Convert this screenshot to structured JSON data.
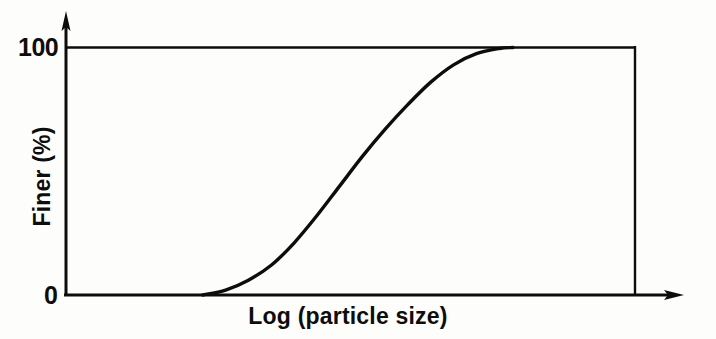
{
  "figure": {
    "background_color": "#fdfdfb",
    "ink_color": "#0d0d0d"
  },
  "axes": {
    "y_tick_top_label": "100",
    "y_tick_bottom_label": "0",
    "y_axis_label": "Finer (%)",
    "x_axis_label": "Log (particle size)"
  },
  "chart_data": {
    "type": "line",
    "title": "",
    "subtitle": "",
    "xlabel": "Log (particle size)",
    "ylabel": "Finer (%)",
    "xlim": [
      0,
      100
    ],
    "ylim": [
      0,
      100
    ],
    "x_tick_labels": [],
    "y_tick_labels": [
      "0",
      "100"
    ],
    "y_ticks": [
      0,
      100
    ],
    "grid": false,
    "legend": null,
    "legend_position": "none",
    "annotations": [],
    "axis_arrows": {
      "x": "right",
      "y": "up"
    },
    "plot_frame": "box",
    "series": [
      {
        "name": "Particle size distribution",
        "description": "Sigmoidal cumulative grain-size distribution curve",
        "line_color": "#0d0d0d",
        "line_width": 3,
        "x": [
          24.0,
          28.0,
          32.0,
          36.0,
          40.0,
          44.0,
          48.0,
          52.0,
          56.0,
          60.0,
          64.0,
          68.0,
          72.0,
          76.0,
          78.4
        ],
        "y": [
          0.0,
          2.0,
          6.0,
          12.0,
          21.0,
          32.0,
          44.0,
          56.0,
          67.0,
          77.0,
          86.0,
          93.0,
          97.5,
          99.6,
          100.0
        ]
      }
    ]
  }
}
